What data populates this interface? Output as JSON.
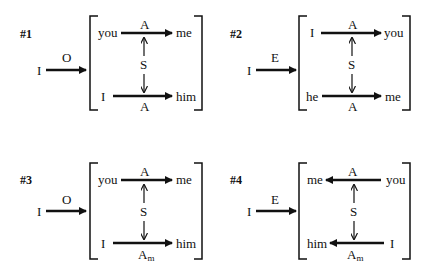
{
  "panels": [
    {
      "id": "#1",
      "entry": {
        "source": "I",
        "label": "O"
      },
      "top": {
        "left": "you",
        "right": "me",
        "label": "A",
        "direction": "right"
      },
      "middle": {
        "label": "S"
      },
      "bottom": {
        "left": "I",
        "right": "him",
        "label": "A",
        "subscript": "",
        "direction": "right"
      }
    },
    {
      "id": "#2",
      "entry": {
        "source": "I",
        "label": "E"
      },
      "top": {
        "left": "I",
        "right": "you",
        "label": "A",
        "direction": "right"
      },
      "middle": {
        "label": "S"
      },
      "bottom": {
        "left": "he",
        "right": "me",
        "label": "A",
        "subscript": "",
        "direction": "right"
      }
    },
    {
      "id": "#3",
      "entry": {
        "source": "I",
        "label": "O"
      },
      "top": {
        "left": "you",
        "right": "me",
        "label": "A",
        "direction": "right"
      },
      "middle": {
        "label": "S"
      },
      "bottom": {
        "left": "I",
        "right": "him",
        "label": "A",
        "subscript": "m",
        "direction": "right"
      }
    },
    {
      "id": "#4",
      "entry": {
        "source": "I",
        "label": "E"
      },
      "top": {
        "left": "me",
        "right": "you",
        "label": "A",
        "direction": "left"
      },
      "middle": {
        "label": "S"
      },
      "bottom": {
        "left": "him",
        "right": "I",
        "label": "A",
        "subscript": "m",
        "direction": "left"
      }
    }
  ]
}
